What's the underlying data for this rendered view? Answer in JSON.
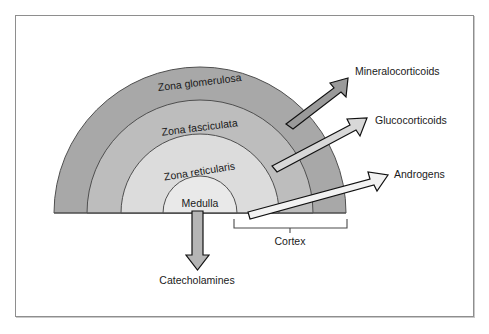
{
  "figure": {
    "frame": {
      "border_color": "#8e8e8e"
    }
  },
  "zones": [
    {
      "id": "zona-glomerulosa",
      "label": "Zona glomerulosa",
      "color": "#a8a8a8",
      "outer_radius": 146,
      "inner_radius": 113
    },
    {
      "id": "zona-fasciculata",
      "label": "Zona fasciculata",
      "color": "#bdbdbd",
      "outer_radius": 113,
      "inner_radius": 79
    },
    {
      "id": "zona-reticularis",
      "label": "Zona reticularis",
      "color": "#dcdcdc",
      "outer_radius": 79,
      "inner_radius": 37
    },
    {
      "id": "medulla",
      "label": "Medulla",
      "color": "#e9e9e9",
      "outer_radius": 37,
      "inner_radius": 0
    }
  ],
  "callouts": [
    {
      "id": "mineralocorticoids",
      "label": "Mineralocorticoids",
      "fill": "#9a9a9a",
      "stroke": "#111111"
    },
    {
      "id": "glucocorticoids",
      "label": "Glucocorticoids",
      "fill": "#d8d8d8",
      "stroke": "#111111"
    },
    {
      "id": "androgens",
      "label": "Androgens",
      "fill": "#f2f2f2",
      "stroke": "#111111"
    },
    {
      "id": "catecholamines",
      "label": "Catecholamines",
      "fill": "#b5b5b5",
      "stroke": "#111111"
    }
  ],
  "bracket": {
    "id": "cortex-bracket",
    "label": "Cortex",
    "stroke": "#4a4a4a"
  },
  "geometry": {
    "center_x": 200,
    "center_y": 213,
    "outer_radius": 146
  }
}
